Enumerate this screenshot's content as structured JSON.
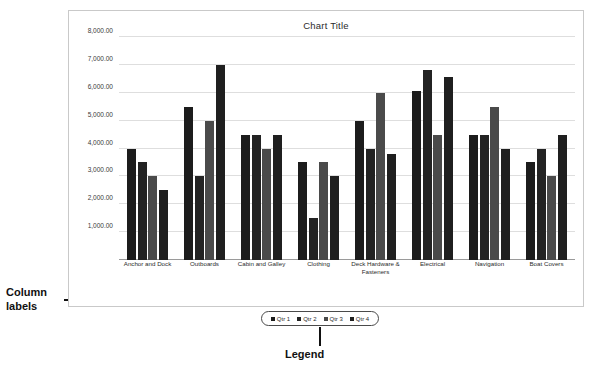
{
  "annotations": {
    "column_labels": "Column labels",
    "legend": "Legend"
  },
  "chart_data": {
    "type": "bar",
    "title": "Chart Title",
    "xlabel": "",
    "ylabel": "",
    "ylim": [
      0,
      8000
    ],
    "ytick_values": [
      8000,
      7000,
      6000,
      5000,
      4000,
      3000,
      2000,
      1000
    ],
    "ytick_labels": [
      "8,000.00",
      "7,000.00",
      "6,000.00",
      "5,000.00",
      "4,000.00",
      "3,000.00",
      "2,000.00",
      "1,000.00"
    ],
    "grid": true,
    "legend_position": "bottom",
    "categories": [
      "Anchor and Dock",
      "Outboards",
      "Cabin and Galley",
      "Clothing",
      "Deck Hardware & Fasteners",
      "Electrical",
      "Navigation",
      "Boat Covers"
    ],
    "series": [
      {
        "name": "Qtr 1",
        "color": "#1c1c1c",
        "values": [
          4000,
          5500,
          4500,
          3500,
          5000,
          6050,
          4500,
          3500
        ]
      },
      {
        "name": "Qtr 2",
        "color": "#232323",
        "values": [
          3500,
          3000,
          4500,
          1500,
          4000,
          6800,
          4500,
          4000
        ]
      },
      {
        "name": "Qtr 3",
        "color": "#4a4a4a",
        "values": [
          3000,
          5000,
          4000,
          3500,
          6000,
          4500,
          5500,
          3000
        ]
      },
      {
        "name": "Qtr 4",
        "color": "#1f1f1f",
        "values": [
          2500,
          7000,
          4500,
          3000,
          3800,
          6550,
          4000,
          4500
        ]
      }
    ]
  }
}
